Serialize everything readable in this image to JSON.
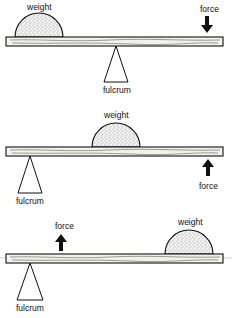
{
  "diagram": {
    "levers": [
      {
        "class": "first-class",
        "weight_label": "weight",
        "force_label": "force",
        "fulcrum_label": "fulcrum",
        "force_direction": "down",
        "order_left_to_right": [
          "weight",
          "fulcrum",
          "force"
        ]
      },
      {
        "class": "second-class",
        "weight_label": "weight",
        "force_label": "force",
        "fulcrum_label": "fulcrum",
        "force_direction": "up",
        "order_left_to_right": [
          "fulcrum",
          "weight",
          "force"
        ]
      },
      {
        "class": "third-class",
        "weight_label": "weight",
        "force_label": "force",
        "fulcrum_label": "fulcrum",
        "force_direction": "up",
        "order_left_to_right": [
          "fulcrum",
          "force",
          "weight"
        ]
      }
    ]
  }
}
